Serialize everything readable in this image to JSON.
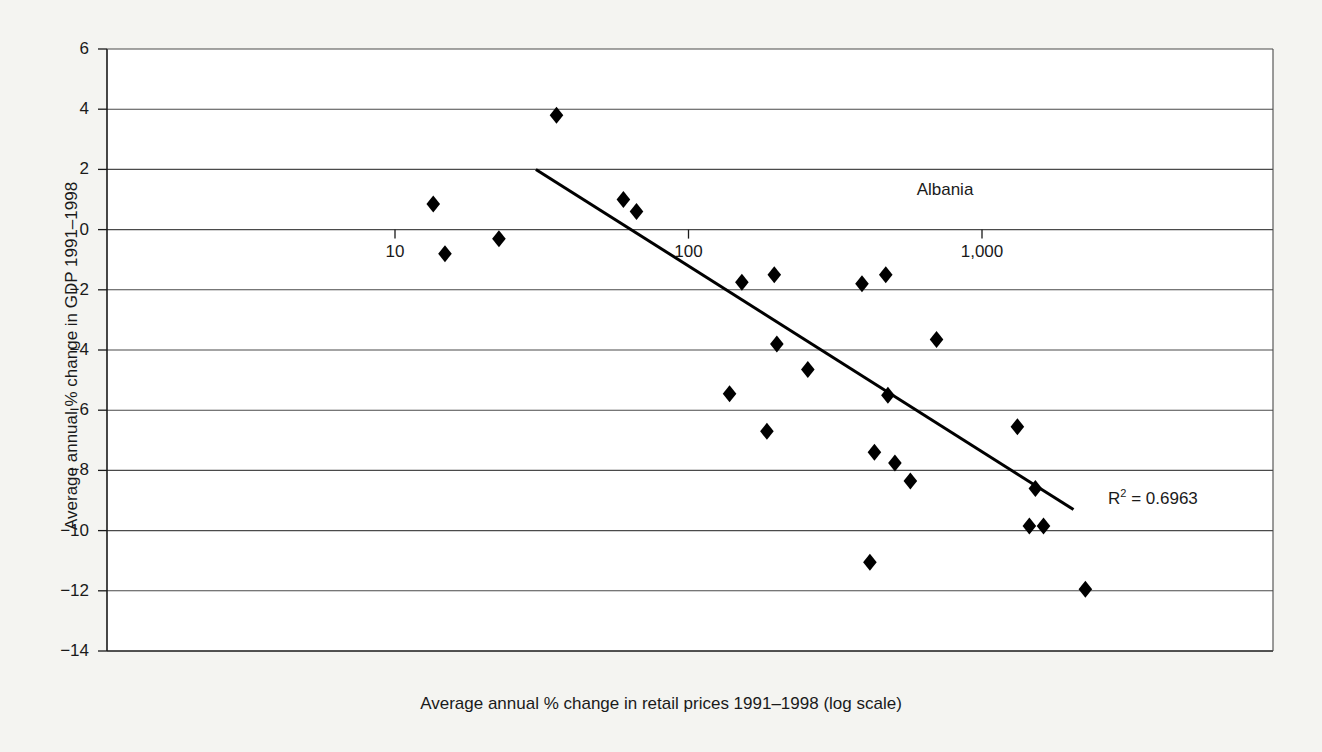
{
  "chart_data": {
    "type": "scatter",
    "title": "",
    "xlabel": "Average annual % change in retail prices 1991–1998 (log scale)",
    "ylabel": "Average annual % change in GDP 1991–1998",
    "xscale": "log",
    "xlim": [
      6.8,
      3100
    ],
    "ylim": [
      -14,
      6
    ],
    "xticks": [
      10,
      100,
      1000
    ],
    "xticklabels": [
      "10",
      "100",
      "1,000"
    ],
    "yticks": [
      6,
      4,
      2,
      0,
      -2,
      -4,
      -6,
      -8,
      -10,
      -12,
      -14
    ],
    "yticklabels": [
      "6",
      "4",
      "2",
      "0",
      "−2",
      "−4",
      "−6",
      "−8",
      "−10",
      "−12",
      "−14"
    ],
    "grid": "horizontal",
    "legend": "none",
    "marker": "diamond",
    "marker_color": "#000000",
    "points": [
      {
        "x": 13.5,
        "y": 0.85
      },
      {
        "x": 14.8,
        "y": -0.8
      },
      {
        "x": 22.6,
        "y": -0.3
      },
      {
        "x": 35.5,
        "y": 3.8
      },
      {
        "x": 60.0,
        "y": 1.0
      },
      {
        "x": 66.5,
        "y": 0.6
      },
      {
        "x": 138,
        "y": -5.45
      },
      {
        "x": 152,
        "y": -1.75
      },
      {
        "x": 185,
        "y": -6.7
      },
      {
        "x": 196,
        "y": -1.5
      },
      {
        "x": 200,
        "y": -3.8
      },
      {
        "x": 255,
        "y": -4.65
      },
      {
        "x": 390,
        "y": -1.8
      },
      {
        "x": 415,
        "y": -11.05
      },
      {
        "x": 430,
        "y": -7.4
      },
      {
        "x": 470,
        "y": -1.5
      },
      {
        "x": 478,
        "y": -5.5
      },
      {
        "x": 505,
        "y": -7.75
      },
      {
        "x": 570,
        "y": -8.35
      },
      {
        "x": 700,
        "y": -3.65
      },
      {
        "x": 1320,
        "y": -6.55
      },
      {
        "x": 1450,
        "y": -9.85
      },
      {
        "x": 1520,
        "y": -8.6
      },
      {
        "x": 1620,
        "y": -9.85
      },
      {
        "x": 2250,
        "y": -11.95
      }
    ],
    "trendline": {
      "x0": 30.2,
      "y0": 2.0,
      "x1": 2050,
      "y1": -9.3,
      "color": "#000000"
    },
    "annotations": [
      {
        "text": "Albania",
        "x": 945,
        "y": 190
      },
      {
        "text": "R² = 0.6963",
        "value": "0.6963"
      }
    ],
    "r_squared_label": "R",
    "r_squared_exp": "2",
    "r_squared_value": "= 0.6963"
  },
  "colors": {
    "background": "#f4f4f1",
    "plot_background": "#ffffff",
    "axis": "#1a1a1a",
    "grid": "#3a3a3a",
    "marker": "#000000"
  }
}
